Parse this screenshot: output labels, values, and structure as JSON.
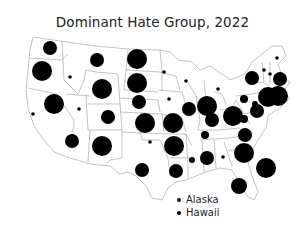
{
  "title": "Dominant Hate Group, 2022",
  "colors": {
    "marker": "#000000",
    "border": "#9a9a9a",
    "background": "#ffffff"
  },
  "legend": {
    "items": [
      {
        "label": "Alaska"
      },
      {
        "label": "Hawaii"
      }
    ]
  },
  "markers": [
    {
      "region": "WA",
      "cx": 50,
      "cy": 48,
      "r": 7
    },
    {
      "region": "OR",
      "cx": 42,
      "cy": 71,
      "r": 10
    },
    {
      "region": "ID",
      "cx": 70,
      "cy": 77,
      "r": 1.8
    },
    {
      "region": "MT",
      "cx": 97,
      "cy": 60,
      "r": 7
    },
    {
      "region": "WY",
      "cx": 102,
      "cy": 89,
      "r": 10
    },
    {
      "region": "NV",
      "cx": 79,
      "cy": 109,
      "r": 1.8
    },
    {
      "region": "CA",
      "cx": 33,
      "cy": 114,
      "r": 1.8
    },
    {
      "region": "CA2",
      "cx": 54,
      "cy": 104,
      "r": 10
    },
    {
      "region": "UT",
      "cx": 108,
      "cy": 117,
      "r": 7
    },
    {
      "region": "AZ",
      "cx": 72,
      "cy": 141,
      "r": 7
    },
    {
      "region": "NM",
      "cx": 102,
      "cy": 146,
      "r": 10
    },
    {
      "region": "CO",
      "cx": 145,
      "cy": 123,
      "r": 10
    },
    {
      "region": "ND",
      "cx": 137,
      "cy": 59,
      "r": 10
    },
    {
      "region": "SD",
      "cx": 137,
      "cy": 83,
      "r": 10
    },
    {
      "region": "NE",
      "cx": 139,
      "cy": 102,
      "r": 7
    },
    {
      "region": "KS",
      "cx": 173,
      "cy": 123,
      "r": 10
    },
    {
      "region": "OK",
      "cx": 150,
      "cy": 142,
      "r": 1.8
    },
    {
      "region": "TX",
      "cx": 142,
      "cy": 170,
      "r": 7
    },
    {
      "region": "MN",
      "cx": 164,
      "cy": 72,
      "r": 1.8
    },
    {
      "region": "IA",
      "cx": 169,
      "cy": 99,
      "r": 1.8
    },
    {
      "region": "WI",
      "cx": 186,
      "cy": 81,
      "r": 1.8
    },
    {
      "region": "MI",
      "cx": 218,
      "cy": 89,
      "r": 1.8
    },
    {
      "region": "IL",
      "cx": 189,
      "cy": 109,
      "r": 7
    },
    {
      "region": "IN",
      "cx": 207,
      "cy": 106,
      "r": 10
    },
    {
      "region": "MO",
      "cx": 174,
      "cy": 146,
      "r": 10
    },
    {
      "region": "AR",
      "cx": 176,
      "cy": 146,
      "r": 0
    },
    {
      "region": "LA",
      "cx": 176,
      "cy": 171,
      "r": 7
    },
    {
      "region": "MS",
      "cx": 192,
      "cy": 160,
      "r": 3
    },
    {
      "region": "AL",
      "cx": 207,
      "cy": 158,
      "r": 7
    },
    {
      "region": "KY",
      "cx": 212,
      "cy": 120,
      "r": 7
    },
    {
      "region": "TN",
      "cx": 205,
      "cy": 135,
      "r": 4
    },
    {
      "region": "GA",
      "cx": 223,
      "cy": 157,
      "r": 1.8
    },
    {
      "region": "OH",
      "cx": 233,
      "cy": 116,
      "r": 10
    },
    {
      "region": "WV",
      "cx": 244,
      "cy": 119,
      "r": 4
    },
    {
      "region": "VA",
      "cx": 257,
      "cy": 111,
      "r": 7
    },
    {
      "region": "PA",
      "cx": 244,
      "cy": 99,
      "r": 4
    },
    {
      "region": "NC",
      "cx": 245,
      "cy": 135,
      "r": 7
    },
    {
      "region": "SC",
      "cx": 244,
      "cy": 153,
      "r": 10
    },
    {
      "region": "FL",
      "cx": 239,
      "cy": 186,
      "r": 8
    },
    {
      "region": "ATL",
      "cx": 266,
      "cy": 168,
      "r": 10
    },
    {
      "region": "NY",
      "cx": 252,
      "cy": 78,
      "r": 7
    },
    {
      "region": "NJ",
      "cx": 255,
      "cy": 104,
      "r": 3
    },
    {
      "region": "MD",
      "cx": 268,
      "cy": 97,
      "r": 10
    },
    {
      "region": "CT",
      "cx": 278,
      "cy": 96,
      "r": 10
    },
    {
      "region": "MA",
      "cx": 280,
      "cy": 79,
      "r": 7
    },
    {
      "region": "RI",
      "cx": 268,
      "cy": 89,
      "r": 1.8
    },
    {
      "region": "VT",
      "cx": 264,
      "cy": 70,
      "r": 1.8
    },
    {
      "region": "NH",
      "cx": 270,
      "cy": 74,
      "r": 1.8
    },
    {
      "region": "ME",
      "cx": 277,
      "cy": 58,
      "r": 1.8
    }
  ]
}
